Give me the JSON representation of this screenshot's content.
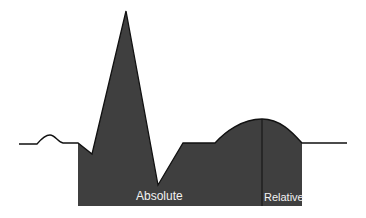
{
  "diagram": {
    "type": "ecg-refractory-period",
    "labels": {
      "absolute": "Absolute",
      "relative": "Relative"
    },
    "colors": {
      "fill": "#3f3f3f",
      "line": "#111111",
      "label": "#f2f2f2",
      "background": "#ffffff"
    }
  }
}
